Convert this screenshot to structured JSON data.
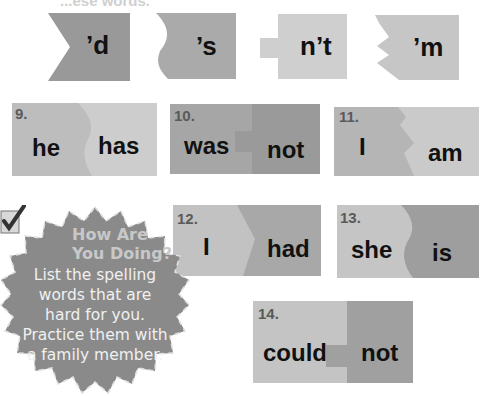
{
  "page": {
    "heading_partial": "...ese words."
  },
  "suffix_pieces": [
    {
      "label": "’d",
      "shape": "chevron-notch",
      "color": "#999999"
    },
    {
      "label": "’s",
      "shape": "wave-notch",
      "color": "#aaaaaa"
    },
    {
      "label": "n’t",
      "shape": "tab-left",
      "color": "#cfcfcf"
    },
    {
      "label": "’m",
      "shape": "zigzag-notch",
      "color": "#c6c6c6"
    }
  ],
  "exercises": [
    {
      "number": "9.",
      "left_word": "he",
      "right_word": "has",
      "left_color": "#bdbdbd",
      "right_color": "#cdcdcd"
    },
    {
      "number": "10.",
      "left_word": "was",
      "right_word": "not",
      "left_color": "#a6a6a6",
      "right_color": "#9a9a9a"
    },
    {
      "number": "11.",
      "left_word": "I",
      "right_word": "am",
      "left_color": "#b5b5b5",
      "right_color": "#cacaca"
    },
    {
      "number": "12.",
      "left_word": "I",
      "right_word": "had",
      "left_color": "#c2c2c2",
      "right_color": "#a8a8a8"
    },
    {
      "number": "13.",
      "left_word": "she",
      "right_word": "is",
      "left_color": "#c5c5c5",
      "right_color": "#9e9e9e"
    },
    {
      "number": "14.",
      "left_word": "could",
      "right_word": "not",
      "left_color": "#c4c4c4",
      "right_color": "#a0a0a0"
    }
  ],
  "badge": {
    "title_line1": "How Are",
    "title_line2": "You Doing?",
    "body_lines": [
      "List the spelling",
      "words that are",
      "hard for you.",
      "Practice them with",
      "a family member."
    ],
    "icon": "checkbox-check-icon",
    "color": "#8a8a8a"
  }
}
